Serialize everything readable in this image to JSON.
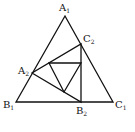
{
  "diagram": {
    "type": "nested-triangles",
    "stroke_color": "#111111",
    "background": "#ffffff",
    "vertices": {
      "A1": {
        "label": "A",
        "sub": "1",
        "x": 65,
        "y": 16
      },
      "B1": {
        "label": "B",
        "sub": "1",
        "x": 16,
        "y": 102
      },
      "C1": {
        "label": "C",
        "sub": "1",
        "x": 113,
        "y": 102
      },
      "A2": {
        "label": "A",
        "sub": "2",
        "x": 32,
        "y": 73
      },
      "B2": {
        "label": "B",
        "sub": "2",
        "x": 81,
        "y": 102
      },
      "C2": {
        "label": "C",
        "sub": "2",
        "x": 81,
        "y": 44
      }
    },
    "inner_triangle": {
      "p1": [
        49,
        63
      ],
      "p2": [
        81,
        63
      ],
      "p3": [
        64,
        92
      ]
    }
  }
}
